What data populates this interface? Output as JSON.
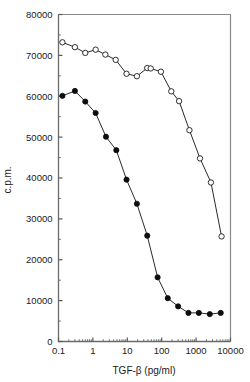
{
  "chart_data": {
    "type": "line",
    "title": "",
    "xlabel": "TGF-β (pg/ml)",
    "ylabel": "c.p.m.",
    "xscale": "log",
    "yscale": "linear",
    "xlim": [
      0.1,
      10000
    ],
    "ylim": [
      0,
      80000
    ],
    "xticks": [
      0.1,
      1,
      10,
      100,
      1000,
      10000
    ],
    "xtick_labels": [
      "0.1",
      "1",
      "10",
      "100",
      "1000",
      "10000"
    ],
    "yticks": [
      0,
      10000,
      20000,
      30000,
      40000,
      50000,
      60000,
      70000,
      80000
    ],
    "ytick_labels": [
      "0",
      "10000",
      "20000",
      "30000",
      "40000",
      "50000",
      "60000",
      "70000",
      "80000"
    ],
    "grid": false,
    "legend": "none",
    "series": [
      {
        "name": "open-circles",
        "marker": "open-circle",
        "color": "#1a1a1a",
        "x": [
          0.13,
          0.3,
          0.6,
          1.2,
          2.3,
          4.6,
          9.5,
          19,
          38,
          48,
          95,
          190,
          320,
          640,
          1300,
          2700,
          5500
        ],
        "y": [
          73200,
          72000,
          70600,
          71400,
          70200,
          68900,
          65500,
          64900,
          66900,
          66800,
          66000,
          61200,
          58800,
          51700,
          44800,
          38900,
          25700
        ]
      },
      {
        "name": "filled-circles",
        "marker": "filled-circle",
        "color": "#0d0d0d",
        "x": [
          0.13,
          0.3,
          0.6,
          1.2,
          2.4,
          4.8,
          9.5,
          19,
          38,
          76,
          150,
          300,
          600,
          1200,
          2500,
          5200
        ],
        "y": [
          60100,
          61300,
          58700,
          55900,
          50100,
          46800,
          39600,
          33700,
          25900,
          15700,
          10600,
          8600,
          7000,
          7000,
          6700,
          7000
        ]
      }
    ]
  },
  "figure": {
    "axis_color": "#6b6b6b",
    "frame_color": "#8a8a8a",
    "background": "#ffffff"
  }
}
